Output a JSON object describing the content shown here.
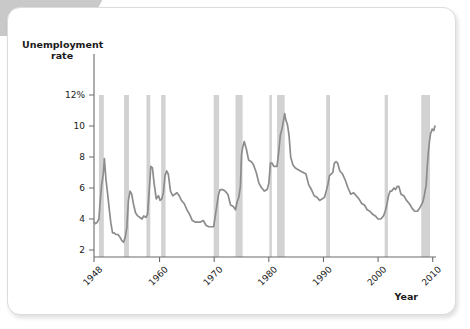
{
  "figure": {
    "background_color": "#ffffff",
    "card_border_color": "#dcdcdc",
    "corner_tab_color": "#c9c9c9"
  },
  "chart_data": {
    "type": "line",
    "title": "",
    "ylabel_line1": "Unemployment",
    "ylabel_line2": "rate",
    "xlabel": "Year",
    "grid": false,
    "legend": "none",
    "line_color": "#8c8c8c",
    "recession_band_color": "#d2d2d2",
    "xlim": [
      1948,
      2010.6
    ],
    "ylim": [
      0,
      12
    ],
    "ytick_values": [
      12,
      10,
      8,
      6,
      4,
      2
    ],
    "ytick_labels": [
      "12%",
      "10",
      "8",
      "6",
      "4",
      "2"
    ],
    "xtick_values": [
      1948,
      1960,
      1970,
      1980,
      1990,
      2000,
      2010
    ],
    "xtick_labels": [
      "1948",
      "1960",
      "1970",
      "1980",
      "1990",
      "2000",
      "2010"
    ],
    "recessions": [
      {
        "label": "1948-1949",
        "start": 1948.9,
        "end": 1949.8
      },
      {
        "label": "1953-1954",
        "start": 1953.5,
        "end": 1954.4
      },
      {
        "label": "1957-1958",
        "start": 1957.6,
        "end": 1958.3
      },
      {
        "label": "1960-1961",
        "start": 1960.3,
        "end": 1961.1
      },
      {
        "label": "1969-1970",
        "start": 1969.9,
        "end": 1970.9
      },
      {
        "label": "1973-1975",
        "start": 1973.9,
        "end": 1975.2
      },
      {
        "label": "1980",
        "start": 1980.1,
        "end": 1980.5
      },
      {
        "label": "1981-1982",
        "start": 1981.5,
        "end": 1982.9
      },
      {
        "label": "1990-1991",
        "start": 1990.5,
        "end": 1991.2
      },
      {
        "label": "2001",
        "start": 2001.2,
        "end": 2001.8
      },
      {
        "label": "2007-2009",
        "start": 2007.9,
        "end": 2009.5
      }
    ],
    "x": [
      1948.0,
      1948.3,
      1948.6,
      1948.9,
      1949.1,
      1949.4,
      1949.7,
      1949.9,
      1950.2,
      1950.5,
      1950.8,
      1951.1,
      1951.4,
      1951.7,
      1952.0,
      1952.4,
      1952.8,
      1953.1,
      1953.4,
      1953.7,
      1954.0,
      1954.3,
      1954.6,
      1954.9,
      1955.2,
      1955.6,
      1956.0,
      1956.4,
      1956.8,
      1957.1,
      1957.5,
      1957.8,
      1958.1,
      1958.4,
      1958.7,
      1959.0,
      1959.4,
      1959.8,
      1960.1,
      1960.4,
      1960.7,
      1961.0,
      1961.3,
      1961.6,
      1962.0,
      1962.4,
      1962.8,
      1963.2,
      1963.6,
      1964.0,
      1964.5,
      1965.0,
      1965.5,
      1966.0,
      1966.5,
      1967.0,
      1967.5,
      1968.0,
      1968.5,
      1969.0,
      1969.5,
      1969.9,
      1970.2,
      1970.5,
      1970.8,
      1971.1,
      1971.5,
      1972.0,
      1972.5,
      1973.0,
      1973.5,
      1973.9,
      1974.2,
      1974.5,
      1974.8,
      1975.0,
      1975.2,
      1975.5,
      1975.9,
      1976.3,
      1976.8,
      1977.2,
      1977.7,
      1978.2,
      1978.7,
      1979.2,
      1979.7,
      1980.0,
      1980.3,
      1980.6,
      1980.9,
      1981.2,
      1981.5,
      1981.8,
      1982.1,
      1982.4,
      1982.7,
      1982.9,
      1983.1,
      1983.4,
      1983.7,
      1984.0,
      1984.4,
      1984.8,
      1985.3,
      1985.8,
      1986.3,
      1986.8,
      1987.3,
      1987.8,
      1988.3,
      1988.8,
      1989.3,
      1989.8,
      1990.2,
      1990.5,
      1990.8,
      1991.1,
      1991.4,
      1991.7,
      1992.0,
      1992.3,
      1992.6,
      1993.0,
      1993.5,
      1994.0,
      1994.5,
      1995.0,
      1995.5,
      1996.0,
      1996.5,
      1997.0,
      1997.5,
      1998.0,
      1998.5,
      1999.0,
      1999.5,
      2000.0,
      2000.5,
      2001.0,
      2001.3,
      2001.6,
      2001.9,
      2002.2,
      2002.5,
      2002.9,
      2003.2,
      2003.5,
      2003.8,
      2004.2,
      2004.7,
      2005.2,
      2005.7,
      2006.2,
      2006.7,
      2007.2,
      2007.6,
      2007.9,
      2008.2,
      2008.5,
      2008.8,
      2009.0,
      2009.2,
      2009.4,
      2009.6,
      2009.9,
      2010.2,
      2010.4
    ],
    "y": [
      3.8,
      3.7,
      3.8,
      4.0,
      5.0,
      6.2,
      6.9,
      7.9,
      6.5,
      5.6,
      4.6,
      3.7,
      3.1,
      3.1,
      3.0,
      3.0,
      2.8,
      2.6,
      2.5,
      2.8,
      3.4,
      5.2,
      5.8,
      5.6,
      5.0,
      4.4,
      4.2,
      4.1,
      4.0,
      4.2,
      4.1,
      4.3,
      5.8,
      7.4,
      7.3,
      6.3,
      5.3,
      5.5,
      5.2,
      5.3,
      5.7,
      6.8,
      7.1,
      6.9,
      5.8,
      5.5,
      5.6,
      5.7,
      5.5,
      5.2,
      5.0,
      4.6,
      4.3,
      3.9,
      3.8,
      3.8,
      3.8,
      3.9,
      3.6,
      3.5,
      3.5,
      3.5,
      4.2,
      4.9,
      5.6,
      5.9,
      5.9,
      5.8,
      5.6,
      4.9,
      4.8,
      4.6,
      5.1,
      5.4,
      6.1,
      8.1,
      8.6,
      9.0,
      8.5,
      7.8,
      7.7,
      7.5,
      7.0,
      6.3,
      6.0,
      5.8,
      5.9,
      6.3,
      7.6,
      7.6,
      7.4,
      7.4,
      7.4,
      8.3,
      9.4,
      9.8,
      10.4,
      10.8,
      10.4,
      10.1,
      9.4,
      8.0,
      7.5,
      7.3,
      7.2,
      7.1,
      7.0,
      6.9,
      6.2,
      5.9,
      5.5,
      5.4,
      5.2,
      5.3,
      5.4,
      5.8,
      6.2,
      6.8,
      6.9,
      7.0,
      7.6,
      7.7,
      7.6,
      7.1,
      6.9,
      6.5,
      6.0,
      5.6,
      5.7,
      5.5,
      5.3,
      5.0,
      4.9,
      4.6,
      4.5,
      4.3,
      4.2,
      4.0,
      4.0,
      4.2,
      4.5,
      4.9,
      5.5,
      5.8,
      5.8,
      6.0,
      5.9,
      6.1,
      6.1,
      5.6,
      5.5,
      5.2,
      5.0,
      4.7,
      4.5,
      4.5,
      4.7,
      4.9,
      5.1,
      5.6,
      6.2,
      7.4,
      8.3,
      9.0,
      9.5,
      9.8,
      9.7,
      10.0
    ]
  }
}
